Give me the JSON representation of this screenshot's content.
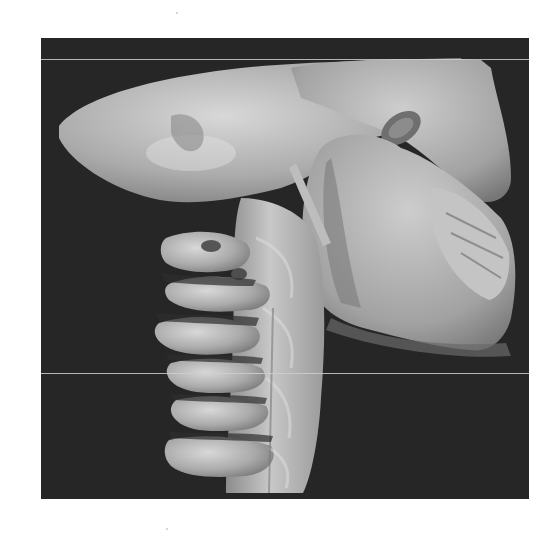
{
  "image": {
    "alt": "3D CT volume rendering, lateral view of skull base, mandible and cervical spine",
    "subject": "skull and cervical vertebrae",
    "view": "lateral",
    "render_style": "grayscale surface rendering",
    "background_color": "#262626",
    "page_color": "#ffffff",
    "bone_color": "#b8b8b8",
    "frame": {
      "x": 41,
      "y": 38,
      "width": 488,
      "height": 461
    },
    "scan_lines_y": [
      59,
      373
    ]
  }
}
